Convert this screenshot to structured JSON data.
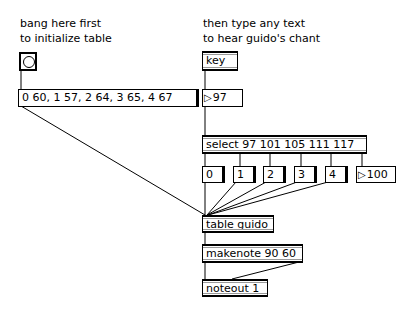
{
  "comments": {
    "left_line1": "bang here first",
    "left_line2": "to initialize table",
    "right_line1": "then type any text",
    "right_line2": "to hear guido's chant"
  },
  "objects": {
    "bang": "bang-button",
    "init_message": "0 60, 1 57, 2 64, 3 65, 4 67",
    "key": "key",
    "keycode_number": "97",
    "select": "select 97 101 105 111 117",
    "index_messages": [
      "0",
      "1",
      "2",
      "3",
      "4"
    ],
    "reject_number": "100",
    "table": "table guido",
    "makenote": "makenote 90 60",
    "noteout": "noteout 1"
  },
  "colors": {
    "background": "#ffffff",
    "foreground": "#000000",
    "inlet_gray": "#999999"
  }
}
